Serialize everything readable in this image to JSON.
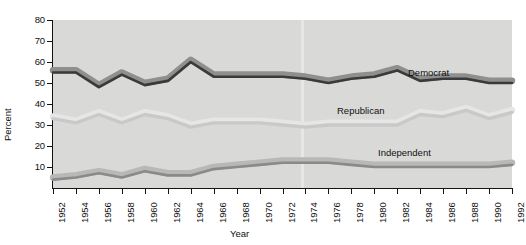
{
  "chart_data": {
    "type": "line",
    "title": "",
    "xlabel": "Year",
    "ylabel": "Percent",
    "xlim": [
      1952,
      1992
    ],
    "ylim": [
      0,
      80
    ],
    "yticks": [
      10,
      20,
      30,
      40,
      50,
      60,
      70,
      80
    ],
    "grid": false,
    "legend_position": "inline-labels",
    "x": [
      1952,
      1954,
      1956,
      1958,
      1960,
      1962,
      1964,
      1966,
      1968,
      1970,
      1972,
      1974,
      1976,
      1978,
      1980,
      1982,
      1984,
      1986,
      1988,
      1990,
      1992
    ],
    "categories": [
      "1952",
      "1954",
      "1956",
      "1958",
      "1960",
      "1962",
      "1964",
      "1966",
      "1968",
      "1970",
      "1972",
      "1974",
      "1976",
      "1978",
      "1980",
      "1982",
      "1984",
      "1986",
      "1988",
      "1990",
      "1992"
    ],
    "series": [
      {
        "name": "Democrat",
        "color": "#3a3a3a",
        "halo_color": "#8f8f8f",
        "values": [
          55,
          55,
          48,
          54,
          49,
          51,
          60,
          53,
          53,
          53,
          53,
          52,
          50,
          52,
          53,
          56,
          51,
          52,
          52,
          50,
          50
        ]
      },
      {
        "name": "Republican",
        "color": "#c9c9c9",
        "halo_color": "#e6e6e6",
        "values": [
          33,
          31,
          35,
          31,
          35,
          33,
          29,
          31,
          31,
          31,
          30,
          29,
          30,
          30,
          30,
          30,
          35,
          34,
          37,
          33,
          36
        ]
      },
      {
        "name": "Independent",
        "color": "#8a8a8a",
        "halo_color": "#b8b8b8",
        "values": [
          4,
          5,
          7,
          5,
          8,
          6,
          6,
          9,
          10,
          11,
          12,
          12,
          12,
          11,
          10,
          10,
          10,
          10,
          10,
          10,
          11
        ]
      }
    ],
    "annotations": [
      {
        "text": "Democrat",
        "series": "Democrat"
      },
      {
        "text": "Republican",
        "series": "Republican"
      },
      {
        "text": "Independent",
        "series": "Independent"
      }
    ]
  },
  "axes": {
    "y_title": "Percent",
    "x_title": "Year",
    "y_tick_labels": [
      "80",
      "70",
      "60",
      "50",
      "40",
      "30",
      "20",
      "10"
    ],
    "x_tick_labels": [
      "1952",
      "1954",
      "1956",
      "1958",
      "1960",
      "1962",
      "1964",
      "1966",
      "1968",
      "1970",
      "1972",
      "1974",
      "1976",
      "1978",
      "1980",
      "1982",
      "1984",
      "1986",
      "1988",
      "1990",
      "1992"
    ]
  },
  "labels": {
    "democrat": "Democrat",
    "republican": "Republican",
    "independent": "Independent"
  },
  "colors": {
    "panel_background": "#d9d9d7",
    "page_background": "#ffffff",
    "axis": "#141414",
    "democrat": "#3a3a3a",
    "republican": "#c9c9c9",
    "independent": "#8a8a8a"
  }
}
